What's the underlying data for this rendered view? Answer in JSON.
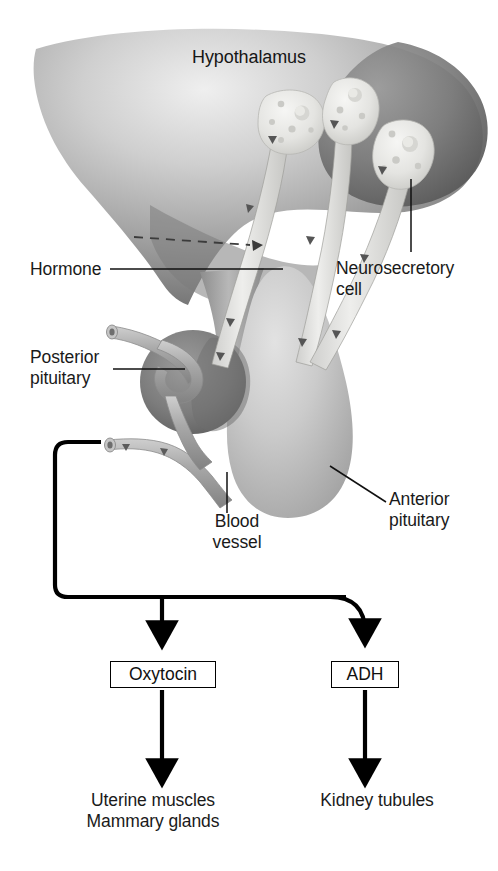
{
  "figure": {
    "type": "biological-diagram"
  },
  "labels": {
    "hypothalamus": "Hypothalamus",
    "hormone": "Hormone",
    "neurosecretory_cell": "Neurosecretory\ncell",
    "posterior_pituitary": "Posterior\npituitary",
    "anterior_pituitary": "Anterior\npituitary",
    "blood_vessel": "Blood\nvessel"
  },
  "hormone_boxes": [
    {
      "name": "Oxytocin",
      "target": "Uterine muscles\nMammary glands"
    },
    {
      "name": "ADH",
      "target": "Kidney tubules"
    }
  ],
  "boxes": {
    "oxytocin": "Oxytocin",
    "adh": "ADH"
  },
  "targets": {
    "oxytocin": "Uterine muscles\nMammary glands",
    "adh": "Kidney tubules"
  },
  "colors": {
    "hypothalamus_light": "#d9d9d9",
    "hypothalamus_dark": "#6f6f6f",
    "posterior_pituitary": "#7a7a7a",
    "anterior_pituitary": "#c2c2c2",
    "neuron_fill": "#e8e8e6",
    "blood_vessel": "#a9a9a9",
    "line": "#000000",
    "text": "#1a1a1a",
    "background": "#ffffff"
  },
  "structures": {
    "neurosecretory_cell_count": 3,
    "flow_arrows": 5
  }
}
